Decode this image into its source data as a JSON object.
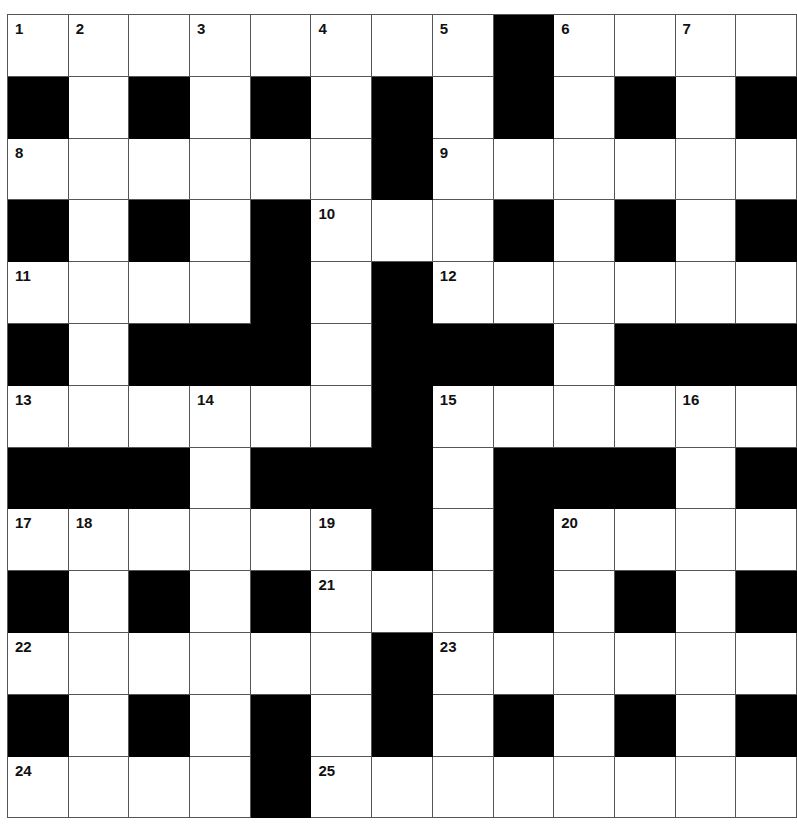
{
  "puzzle": {
    "type": "crossword",
    "rows": 13,
    "cols": 13,
    "colors": {
      "block": "#000000",
      "cell": "#ffffff",
      "line": "#555555"
    },
    "grid": [
      [
        "1",
        "2",
        ".",
        "3",
        ".",
        "4",
        ".",
        "5",
        "#",
        "6",
        ".",
        "7",
        "."
      ],
      [
        "#",
        ".",
        "#",
        ".",
        "#",
        ".",
        "#",
        ".",
        "#",
        ".",
        "#",
        ".",
        "#"
      ],
      [
        "8",
        ".",
        ".",
        ".",
        ".",
        ".",
        "#",
        "9",
        ".",
        ".",
        ".",
        ".",
        "."
      ],
      [
        "#",
        ".",
        "#",
        ".",
        "#",
        "10",
        ".",
        ".",
        "#",
        ".",
        "#",
        ".",
        "#"
      ],
      [
        "11",
        ".",
        ".",
        ".",
        "#",
        ".",
        "#",
        "12",
        ".",
        ".",
        ".",
        ".",
        "."
      ],
      [
        "#",
        ".",
        "#",
        "#",
        "#",
        ".",
        "#",
        "#",
        "#",
        ".",
        "#",
        "#",
        "#"
      ],
      [
        "13",
        ".",
        ".",
        "14",
        ".",
        ".",
        "#",
        "15",
        ".",
        ".",
        ".",
        "16",
        "."
      ],
      [
        "#",
        "#",
        "#",
        ".",
        "#",
        "#",
        "#",
        ".",
        "#",
        "#",
        "#",
        ".",
        "#"
      ],
      [
        "17",
        "18",
        ".",
        ".",
        ".",
        "19",
        "#",
        ".",
        "#",
        "20",
        ".",
        ".",
        "."
      ],
      [
        "#",
        ".",
        "#",
        ".",
        "#",
        "21",
        ".",
        ".",
        "#",
        ".",
        "#",
        ".",
        "#"
      ],
      [
        "22",
        ".",
        ".",
        ".",
        ".",
        ".",
        "#",
        "23",
        ".",
        ".",
        ".",
        ".",
        "."
      ],
      [
        "#",
        ".",
        "#",
        ".",
        "#",
        ".",
        "#",
        ".",
        "#",
        ".",
        "#",
        ".",
        "#"
      ],
      [
        "24",
        ".",
        ".",
        ".",
        "#",
        "25",
        ".",
        ".",
        ".",
        ".",
        ".",
        ".",
        "."
      ]
    ]
  }
}
